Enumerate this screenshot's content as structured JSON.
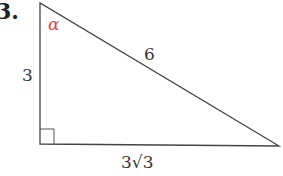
{
  "problem_number": "3.",
  "angle_label": "α",
  "angle_color": "#e0464a",
  "sides": {
    "vertical": "3",
    "hypotenuse": "6",
    "horizontal": "3√3"
  },
  "figure": "right triangle with right angle at bottom-left"
}
